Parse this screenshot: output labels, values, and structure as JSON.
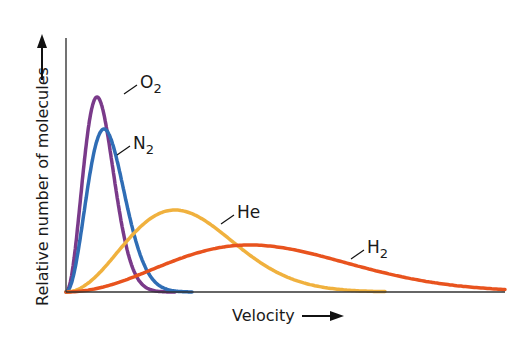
{
  "chart_data": {
    "type": "line",
    "title": "",
    "xlabel": "Velocity",
    "ylabel": "Relative number of molecules",
    "grid": false,
    "legend": "inline labels",
    "axis_px": {
      "origin": [
        66,
        292
      ],
      "y_top": 38,
      "x_end": 505
    },
    "series": [
      {
        "name": "O2",
        "label_main": "O",
        "label_sub": "2",
        "color": "#7a3a8a",
        "peak_px": [
          97,
          97
        ],
        "end_px": 175,
        "label_px": [
          140,
          82
        ]
      },
      {
        "name": "N2",
        "label_main": "N",
        "label_sub": "2",
        "color": "#2f6db5",
        "peak_px": [
          104,
          129
        ],
        "end_px": 192,
        "label_px": [
          133,
          143
        ]
      },
      {
        "name": "He",
        "label_main": "He",
        "label_sub": "",
        "color": "#f0b13e",
        "peak_px": [
          175,
          210
        ],
        "end_px": 385,
        "label_px": [
          237,
          212
        ]
      },
      {
        "name": "H2",
        "label_main": "H",
        "label_sub": "2",
        "color": "#e8531e",
        "peak_px": [
          250,
          245
        ],
        "end_px": 505,
        "label_px": [
          367,
          247
        ]
      }
    ]
  },
  "axes": {
    "xlabel": "Velocity",
    "ylabel": "Relative number of molecules"
  }
}
